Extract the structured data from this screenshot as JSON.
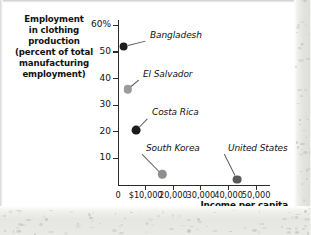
{
  "chart_data": {
    "type": "scatter",
    "title": "",
    "ylabel": "Employment in clothing production (percent of total manufacturing employment)",
    "ylabel_lines": [
      "Employment",
      "in clothing",
      "production",
      "(percent of total",
      "manufacturing",
      "employment)"
    ],
    "xlabel": "Income per capita",
    "xlim": [
      0,
      55000
    ],
    "ylim": [
      0,
      62
    ],
    "grid": false,
    "legend": "none",
    "yticks": [
      10,
      20,
      30,
      40,
      50,
      60
    ],
    "ytick_labels": [
      "10",
      "20",
      "30",
      "40",
      "50",
      "60%"
    ],
    "xticks": [
      0,
      10000,
      20000,
      30000,
      40000,
      50000
    ],
    "xtick_labels": [
      "0",
      "$10,000",
      "20,000",
      "30,000",
      "40,000",
      "50,000"
    ],
    "points": [
      {
        "name": "Bangladesh",
        "x": 2000,
        "y": 52.0,
        "color": "#1c1c1c",
        "radius": 4.4,
        "label_x": 150,
        "label_y": 30
      },
      {
        "name": "El Salvador",
        "x": 3500,
        "y": 36.0,
        "color": "#9b9b9b",
        "radius": 4.2,
        "label_x": 143,
        "label_y": 69
      },
      {
        "name": "Costa Rica",
        "x": 6500,
        "y": 20.5,
        "color": "#1c1c1c",
        "radius": 4.4,
        "label_x": 152,
        "label_y": 107
      },
      {
        "name": "South Korea",
        "x": 16000,
        "y": 4.0,
        "color": "#8f8f8f",
        "radius": 4.2,
        "label_x": 146,
        "label_y": 143
      },
      {
        "name": "United States",
        "x": 43000,
        "y": 2.0,
        "color": "#5a5a5a",
        "radius": 4.4,
        "label_x": 228,
        "label_y": 143
      }
    ]
  }
}
